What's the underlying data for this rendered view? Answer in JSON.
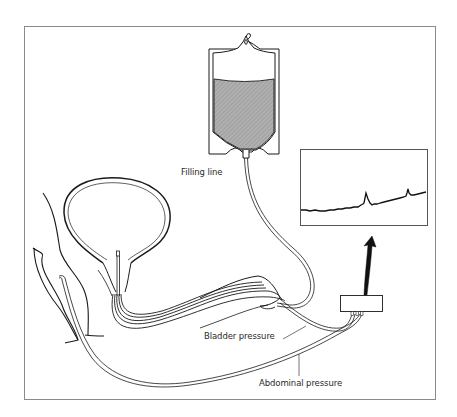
{
  "figure": {
    "type": "urodynamics-setup-diagram",
    "frame_color": "#8a8a8a",
    "line_color": "#1a1a1a",
    "fluid_fill_color": "#a9a9a9"
  },
  "labels": {
    "filling_line": "Filling line",
    "bladder_pressure": "Bladder pressure",
    "abdominal_pressure": "Abdominal pressure"
  },
  "components": [
    {
      "id": "fluid-bag",
      "description": "Saline infusion bag, partially filled"
    },
    {
      "id": "bladder",
      "description": "Bladder cross-section with catheter"
    },
    {
      "id": "rectum",
      "description": "Rectal line for abdominal pressure"
    },
    {
      "id": "transducer-box",
      "description": "Pressure transducer"
    },
    {
      "id": "trace-monitor",
      "description": "Pressure trace display with two peaks"
    },
    {
      "id": "arrow",
      "description": "Curved arrow from transducer to monitor"
    }
  ]
}
